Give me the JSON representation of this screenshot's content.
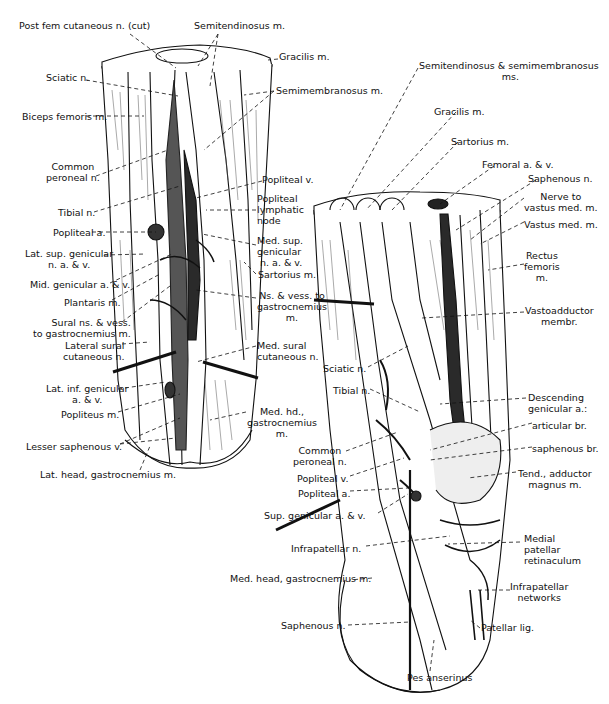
{
  "figure": {
    "left_view": {
      "labels": [
        {
          "id": "post-fem-cut",
          "text": "Post fem cutaneous n. (cut)",
          "x": 19,
          "y": 25
        },
        {
          "id": "semitendinosus",
          "text": "Semitendinosus m.",
          "x": 194,
          "y": 25
        },
        {
          "id": "gracilis",
          "text": "Gracilis m.",
          "x": 279,
          "y": 56
        },
        {
          "id": "sciatic",
          "text": "Sciatic n.",
          "x": 46,
          "y": 76
        },
        {
          "id": "semimembranosus",
          "text": "Semimembranosus m.",
          "x": 276,
          "y": 88
        },
        {
          "id": "biceps-femoris",
          "text": "Biceps femoris m.",
          "x": 22,
          "y": 112
        },
        {
          "id": "common-peroneal",
          "text": "Common\nperoneal n.",
          "x": 46,
          "y": 166,
          "align": "center"
        },
        {
          "id": "popliteal-v",
          "text": "Popliteal v.",
          "x": 262,
          "y": 178
        },
        {
          "id": "popliteal-lymph",
          "text": "Popliteal\nlymphatic\nnode",
          "x": 257,
          "y": 196
        },
        {
          "id": "tibial",
          "text": "Tibial n.",
          "x": 58,
          "y": 208
        },
        {
          "id": "popliteal-a",
          "text": "Popliteal a.",
          "x": 53,
          "y": 228
        },
        {
          "id": "med-sup-genicular",
          "text": "Med. sup.\ngenicular\n n. a. & v.",
          "x": 257,
          "y": 238
        },
        {
          "id": "lat-sup-genicular",
          "text": "Lat. sup. genicular\nn. a. & v.",
          "x": 25,
          "y": 248,
          "align": "center"
        },
        {
          "id": "sartorius",
          "text": "Sartorius m.",
          "x": 258,
          "y": 272
        },
        {
          "id": "mid-genicular",
          "text": "Mid. genicular a. & v.",
          "x": 30,
          "y": 280
        },
        {
          "id": "ns-vess-gastroc",
          "text": "Ns. & vess. to\ngastrocnemius\nm.",
          "x": 257,
          "y": 293,
          "align": "center"
        },
        {
          "id": "plantaris",
          "text": "Plantaris m.",
          "x": 64,
          "y": 297
        },
        {
          "id": "sural-ns",
          "text": "Sural ns. & vess.\nto gastrocnemius m.",
          "x": 33,
          "y": 318,
          "align": "right"
        },
        {
          "id": "med-sural-cut",
          "text": "Med. sural\ncutaneous n.",
          "x": 257,
          "y": 343
        },
        {
          "id": "lateral-sural-cut",
          "text": "Lateral sural\ncutaneous n.",
          "x": 63,
          "y": 341,
          "align": "right"
        },
        {
          "id": "lat-inf-genicular",
          "text": "Lat. inf. genicular\na. & v.",
          "x": 46,
          "y": 383,
          "align": "center"
        },
        {
          "id": "med-hd-gastroc",
          "text": "Med. hd.,\ngastrocnemius\nm.",
          "x": 247,
          "y": 407,
          "align": "center"
        },
        {
          "id": "popliteus",
          "text": "Popliteus m.",
          "x": 61,
          "y": 409
        },
        {
          "id": "lesser-saphenous",
          "text": "Lesser saphenous v.",
          "x": 26,
          "y": 441
        },
        {
          "id": "lat-head-gastroc",
          "text": "Lat. head, gastrocnemius m.",
          "x": 40,
          "y": 469
        }
      ]
    },
    "right_view": {
      "labels": [
        {
          "id": "semiten-semimem",
          "text": "Semitendinosus & semimembranosus\n ms.",
          "x": 419,
          "y": 62,
          "align": "center"
        },
        {
          "id": "gracilis-r",
          "text": "Gracilis m.",
          "x": 434,
          "y": 106
        },
        {
          "id": "sartorius-r",
          "text": "Sartorius m.",
          "x": 451,
          "y": 137
        },
        {
          "id": "femoral-av",
          "text": "Femoral a. & v.",
          "x": 482,
          "y": 160
        },
        {
          "id": "saphenous-n-top",
          "text": "Saphenous n.",
          "x": 528,
          "y": 173
        },
        {
          "id": "nerve-vastus",
          "text": "Nerve to\nvastus med. m.",
          "x": 524,
          "y": 191,
          "align": "center"
        },
        {
          "id": "vastus-med",
          "text": "Vastus med. m.",
          "x": 524,
          "y": 219
        },
        {
          "id": "rectus-femoris",
          "text": "Rectus\nfemoris\nm.",
          "x": 524,
          "y": 250,
          "align": "center"
        },
        {
          "id": "vastoadductor",
          "text": "Vastoadductor\nmembr.",
          "x": 525,
          "y": 306,
          "align": "center"
        },
        {
          "id": "sciatic-r",
          "text": "Sciatic n.",
          "x": 323,
          "y": 364
        },
        {
          "id": "tibial-r",
          "text": "Tibial n.",
          "x": 333,
          "y": 386
        },
        {
          "id": "descending-genicular",
          "text": "Descending\ngenicular a.:",
          "x": 528,
          "y": 392
        },
        {
          "id": "articular-br",
          "text": "articular br.",
          "x": 532,
          "y": 419
        },
        {
          "id": "saphenous-br",
          "text": "saphenous br.",
          "x": 532,
          "y": 443
        },
        {
          "id": "common-peroneal-r",
          "text": "Common\nperoneal n.",
          "x": 293,
          "y": 446,
          "align": "center"
        },
        {
          "id": "tend-adductor",
          "text": "Tend., adductor\nmagnus m.",
          "x": 518,
          "y": 468,
          "align": "center"
        },
        {
          "id": "popliteal-v-r",
          "text": "Popliteal v.",
          "x": 297,
          "y": 473
        },
        {
          "id": "popliteal-a-r",
          "text": "Popliteal a.",
          "x": 298,
          "y": 488
        },
        {
          "id": "sup-genicular",
          "text": "Sup. genicular a. & v.",
          "x": 264,
          "y": 510
        },
        {
          "id": "medial-patellar",
          "text": "Medial\npatellar\nretinaculum",
          "x": 524,
          "y": 534
        },
        {
          "id": "infrapatellar-n",
          "text": "Infrapatellar n.",
          "x": 291,
          "y": 543
        },
        {
          "id": "infrapatellar-net",
          "text": "Infrapatellar\nnetworks",
          "x": 510,
          "y": 582,
          "align": "center"
        },
        {
          "id": "med-head-gastroc-r",
          "text": "Med. head, gastrocnemius m.",
          "x": 230,
          "y": 574
        },
        {
          "id": "saphenous-n-r",
          "text": "Saphenous n.",
          "x": 281,
          "y": 621
        },
        {
          "id": "patellar-lig",
          "text": "Patellar lig.",
          "x": 481,
          "y": 624
        },
        {
          "id": "pes-anserinus",
          "text": "Pes anserinus",
          "x": 407,
          "y": 671
        }
      ]
    }
  }
}
